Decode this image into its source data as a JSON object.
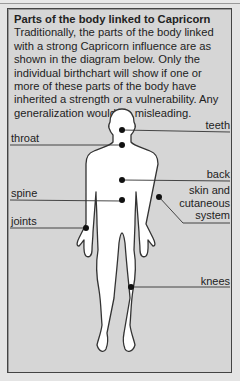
{
  "panel": {
    "title": "Parts of the body linked to Capricorn",
    "body": "Traditionally, the parts of the body linked with a strong Capricorn influence are as shown in the diagram below. Only the individual birthchart will show if one or more of these parts of the body have inherited a strength or a vulnerability. Any generalization would be misleading."
  },
  "diagram": {
    "labels": {
      "teeth": "teeth",
      "throat": "throat",
      "back": "back",
      "spine": "spine",
      "skin_line1": "skin and",
      "skin_line2": "cutaneous",
      "skin_line3": "system",
      "joints": "joints",
      "knees": "knees"
    }
  },
  "colors": {
    "background": "#d6d6d6",
    "figure_fill": "#ffffff",
    "ink": "#222222"
  }
}
